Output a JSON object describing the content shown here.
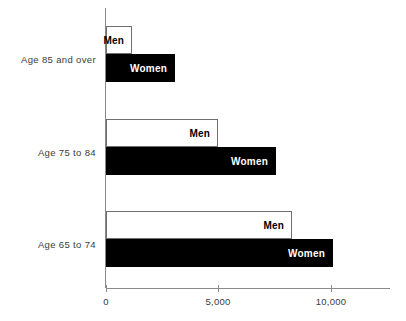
{
  "chart_data": {
    "type": "bar",
    "orientation": "horizontal",
    "title": "",
    "subtitle": "",
    "xlabel": "",
    "ylabel": "",
    "categories": [
      "Age 85 and over",
      "Age 75 to 84",
      "Age 65 to 74"
    ],
    "series": [
      {
        "name": "Men",
        "values": [
          1150,
          4980,
          8270
        ]
      },
      {
        "name": "Women",
        "values": [
          3070,
          7560,
          10090
        ]
      }
    ],
    "series_labels_inside_bars": true,
    "xlim": [
      0,
      12600
    ],
    "xticks": [
      0,
      5000,
      10000
    ],
    "xticklabels": [
      "0",
      "5,000",
      "10,000"
    ],
    "grid": false,
    "legend": "none",
    "colors": {
      "men_fill": "#ffffff",
      "men_border": "#6f6f6f",
      "women_fill": "#000000",
      "axis": "#8a8a8a",
      "text": "#3b3b3b",
      "background": "#ffffff"
    }
  }
}
